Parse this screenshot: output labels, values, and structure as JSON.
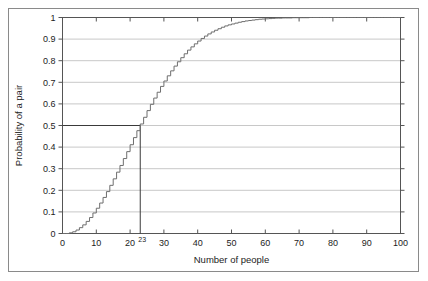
{
  "chart_data": {
    "type": "line",
    "title": "",
    "xlabel": "Number of people",
    "ylabel": "Probability of a pair",
    "xlim": [
      0,
      100
    ],
    "ylim": [
      0,
      1
    ],
    "grid": true,
    "legend": false,
    "legend_position": "none",
    "xticks": [
      0,
      10,
      20,
      30,
      40,
      50,
      60,
      70,
      80,
      90,
      100
    ],
    "xtick_labels": [
      "0",
      "10",
      "20",
      "30",
      "40",
      "50",
      "60",
      "70",
      "80",
      "90",
      "100"
    ],
    "yticks": [
      0,
      0.1,
      0.2,
      0.3,
      0.4,
      0.5,
      0.6,
      0.7,
      0.8,
      0.9,
      1
    ],
    "ytick_labels": [
      "0",
      "0.1",
      "0.2",
      "0.3",
      "0.4",
      "0.5",
      "0.6",
      "0.7",
      "0.8",
      "0.9",
      "1"
    ],
    "series": [
      {
        "name": "Probability of a shared birthday",
        "color": "#6e6e6e",
        "step": true,
        "x": [
          0,
          1,
          2,
          3,
          4,
          5,
          6,
          7,
          8,
          9,
          10,
          11,
          12,
          13,
          14,
          15,
          16,
          17,
          18,
          19,
          20,
          21,
          22,
          23,
          24,
          25,
          26,
          27,
          28,
          29,
          30,
          31,
          32,
          33,
          34,
          35,
          36,
          37,
          38,
          39,
          40,
          41,
          42,
          43,
          44,
          45,
          46,
          47,
          48,
          49,
          50,
          51,
          52,
          53,
          54,
          55,
          56,
          57,
          58,
          59,
          60,
          61,
          62,
          63,
          64,
          65,
          66,
          67,
          68,
          69,
          70,
          71,
          72,
          73,
          74,
          75,
          76,
          77,
          78,
          79,
          80,
          81,
          82,
          83,
          84,
          85,
          86,
          87,
          88,
          89,
          90,
          91,
          92,
          93,
          94,
          95,
          96,
          97,
          98,
          99,
          100
        ],
        "values": [
          0,
          0,
          0.003,
          0.008,
          0.016,
          0.027,
          0.04,
          0.056,
          0.074,
          0.095,
          0.117,
          0.141,
          0.167,
          0.194,
          0.223,
          0.253,
          0.284,
          0.315,
          0.347,
          0.379,
          0.411,
          0.444,
          0.476,
          0.507,
          0.538,
          0.569,
          0.598,
          0.627,
          0.654,
          0.681,
          0.706,
          0.73,
          0.753,
          0.775,
          0.795,
          0.814,
          0.832,
          0.849,
          0.864,
          0.878,
          0.891,
          0.903,
          0.914,
          0.924,
          0.933,
          0.941,
          0.948,
          0.955,
          0.961,
          0.966,
          0.97,
          0.974,
          0.978,
          0.981,
          0.984,
          0.986,
          0.988,
          0.99,
          0.992,
          0.993,
          0.994,
          0.995,
          0.996,
          0.997,
          0.997,
          0.998,
          0.998,
          0.998,
          0.999,
          0.999,
          0.999,
          0.999,
          0.999,
          1,
          1,
          1,
          1,
          1,
          1,
          1,
          1,
          1,
          1,
          1,
          1,
          1,
          1,
          1,
          1,
          1,
          1,
          1,
          1,
          1,
          1,
          1,
          1,
          1,
          1,
          1,
          1
        ]
      }
    ],
    "annotations": [
      {
        "name": "half-probability-marker",
        "label": "23",
        "x": 23,
        "y": 0.5,
        "description": "Guide lines marking the point where probability reaches 0.5 at 23 people"
      }
    ]
  },
  "axes": {
    "x_title": "Number of people",
    "y_title": "Probability of a pair"
  },
  "colors": {
    "curve": "#6e6e6e",
    "grid": "#c8c8c8",
    "axis": "#555555",
    "frame": "#8a8a8a",
    "guide": "#3a3a3a",
    "text": "#1c1c1c"
  }
}
